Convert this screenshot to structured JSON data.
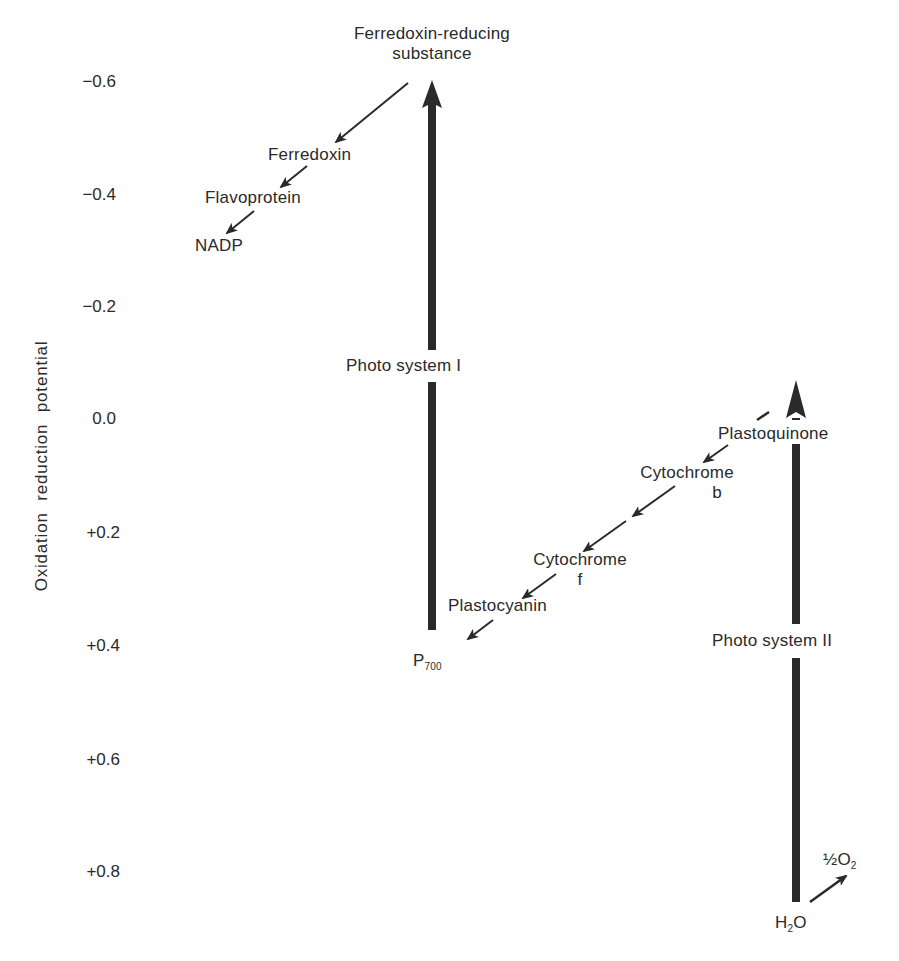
{
  "diagram": {
    "type": "photosynthesis-z-scheme",
    "y_axis": {
      "label": "Oxidation reduction potential",
      "ticks": [
        "−0.6",
        "−0.4",
        "−0.2",
        "0.0",
        "+0.2",
        "+0.4",
        "+0.6",
        "+0.8"
      ]
    },
    "photosystem_1": {
      "label": "Photo system I",
      "bottom": "P",
      "bottom_sub": "700",
      "top": "Ferredoxin-reducing",
      "top_line2": "substance"
    },
    "photosystem_2": {
      "label": "Photo system II",
      "bottom": "H",
      "bottom_sub": "2",
      "bottom_tail": "O",
      "oxygen": "½O",
      "oxygen_sub": "2"
    },
    "nadp_chain": {
      "ferredoxin": "Ferredoxin",
      "flavoprotein": "Flavoprotein",
      "nadp": "NADP"
    },
    "electron_chain": {
      "plastoquinone": "Plastoquinone",
      "cytochrome_b": "Cytochrome",
      "cytochrome_b_letter": "b",
      "cytochrome_f": "Cytochrome",
      "cytochrome_f_letter": "f",
      "plastocyanin": "Plastocyanin"
    },
    "colors": {
      "ink": "#2a2a2a",
      "background": "#ffffff"
    }
  }
}
